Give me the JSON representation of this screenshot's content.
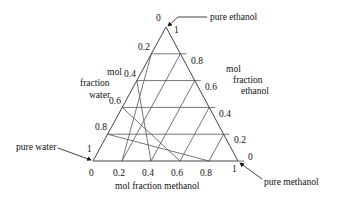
{
  "diagram": {
    "type": "ternary-diagram",
    "vertices": {
      "top": {
        "label": "pure ethanol",
        "x": 166,
        "y": 27
      },
      "bottom_left": {
        "label": "pure water",
        "x": 93,
        "y": 161
      },
      "bottom_right": {
        "label": "pure methanol",
        "x": 238,
        "y": 161
      }
    },
    "axes": {
      "water": {
        "title_lines": [
          "mol",
          "fraction",
          "water"
        ],
        "ticks": [
          "0",
          "0.2",
          "0.4",
          "0.6",
          "0.8",
          "1"
        ]
      },
      "ethanol": {
        "title_lines": [
          "mol",
          "fraction",
          "ethanol"
        ],
        "ticks": [
          "1",
          "0.8",
          "0.6",
          "0.4",
          "0.2",
          "0"
        ]
      },
      "methanol": {
        "title": "mol fraction methanol",
        "ticks": [
          "0",
          "0.2",
          "0.4",
          "0.6",
          "0.8",
          "1"
        ]
      }
    },
    "divisions": 5,
    "colors": {
      "line": "#555555",
      "text": "#111111"
    }
  }
}
